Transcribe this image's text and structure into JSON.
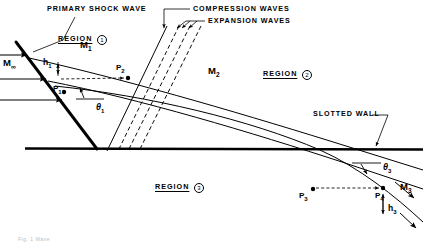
{
  "figure": {
    "background": "#ffffff",
    "ink": "#000000",
    "width": 423,
    "height": 244
  },
  "callouts": {
    "primary_shock_wave": "PRIMARY  SHOCK  WAVE",
    "compression_waves": "COMPRESSION   WAVES",
    "expansion_waves": "EXPANSION  WAVES",
    "slotted_wall": "SLOTTED  WALL"
  },
  "regions": [
    {
      "label": "REGION",
      "number": "1",
      "x": 58,
      "y": 28
    },
    {
      "label": "REGION",
      "number": "2",
      "x": 263,
      "y": 63
    },
    {
      "label": "REGION",
      "number": "3",
      "x": 155,
      "y": 176
    }
  ],
  "mach_numbers": [
    {
      "text": "M",
      "sub": "∞",
      "x": 3,
      "y": 60
    },
    {
      "text": "M",
      "sub": "1",
      "x": 80,
      "y": 40
    },
    {
      "text": "M",
      "sub": "2",
      "x": 208,
      "y": 66
    },
    {
      "text": "M",
      "sub": "3",
      "x": 400,
      "y": 182
    }
  ],
  "pressure_points": [
    {
      "text": "P",
      "sub": "1",
      "label_x": 57,
      "label_y": 89,
      "dot_x": 64,
      "dot_y": 92
    },
    {
      "text": "P",
      "sub": "2",
      "label_x": 118,
      "label_y": 66,
      "dot_x": 128,
      "dot_y": 78
    },
    {
      "text": "P",
      "sub": "3",
      "label_x": 303,
      "label_y": 192,
      "dot_x": 313,
      "dot_y": 189
    },
    {
      "text": "P",
      "sub": "4",
      "label_x": 378,
      "label_y": 193,
      "dot_x": 383,
      "dot_y": 188
    }
  ],
  "angles": [
    {
      "text": "θ",
      "sub": "1",
      "x": 96,
      "y": 106
    },
    {
      "text": "θ",
      "sub": "3",
      "x": 383,
      "y": 166
    }
  ],
  "heights": [
    {
      "text": "h",
      "sub": "1",
      "x": 44,
      "y": 62
    },
    {
      "text": "h",
      "sub": "3",
      "x": 389,
      "y": 208
    }
  ],
  "caption_fragment": "Fig. 1  Wave",
  "geometry": {
    "wall_y": 148,
    "apex": {
      "x": 97,
      "y": 149
    },
    "shock_top": {
      "x": 16,
      "y": 42
    },
    "flow_arrow_ys": [
      55,
      79,
      100
    ]
  }
}
